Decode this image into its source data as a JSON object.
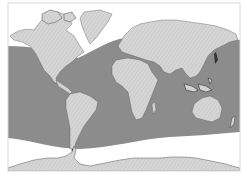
{
  "map": {
    "title": "World map",
    "projection": "equirectangular",
    "frame": {
      "x": 8,
      "y": 3,
      "width": 232,
      "height": 168
    },
    "colors": {
      "background": "#ffffff",
      "frame": "#d8d8d8",
      "shaded_ocean": "#8c8c8c",
      "land": "#d6d6d6",
      "land_hatch": "#bdbdbd",
      "coast_detail": "#3a3a3a",
      "polar_white": "#ffffff"
    },
    "legend": [],
    "regions": [
      {
        "name": "shaded-ocean-band",
        "description": "Gray shaded ocean region between curved northern and southern boundaries"
      },
      {
        "name": "northern-unshaded-zone",
        "description": "White area north of the band (Arctic)"
      },
      {
        "name": "southern-unshaded-zone",
        "description": "White area south of the band (Southern Ocean)"
      }
    ],
    "landmasses": [
      "North America",
      "Greenland",
      "South America",
      "Europe",
      "Africa",
      "Asia",
      "Australia",
      "Antarctica"
    ]
  }
}
